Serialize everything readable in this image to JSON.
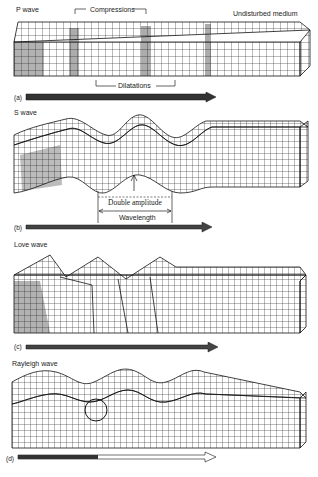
{
  "figure": {
    "panels": [
      {
        "id": "a",
        "title": "P wave",
        "tag": "(a)",
        "annotations": {
          "top": "Compressions",
          "right": "Undisturbed medium",
          "bottom": "Dilatations"
        }
      },
      {
        "id": "b",
        "title": "S wave",
        "tag": "(b)",
        "annotations": {
          "amplitude": "Double amplitude",
          "wavelength": "Wavelength"
        }
      },
      {
        "id": "c",
        "title": "Love wave",
        "tag": "(c)"
      },
      {
        "id": "d",
        "title": "Rayleigh wave",
        "tag": "(d)"
      }
    ]
  },
  "colors": {
    "ink": "#111111",
    "paper": "#ffffff",
    "grid": "#1a1a1a"
  }
}
